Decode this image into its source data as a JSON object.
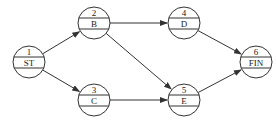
{
  "diagram": {
    "type": "activity-on-node network",
    "nodes": [
      {
        "id": "1",
        "number": "1",
        "name": "ST",
        "x": 29,
        "y": 62
      },
      {
        "id": "2",
        "number": "2",
        "name": "B",
        "x": 94,
        "y": 23
      },
      {
        "id": "3",
        "number": "3",
        "name": "C",
        "x": 94,
        "y": 100
      },
      {
        "id": "4",
        "number": "4",
        "name": "D",
        "x": 184,
        "y": 23
      },
      {
        "id": "5",
        "number": "5",
        "name": "E",
        "x": 184,
        "y": 100
      },
      {
        "id": "6",
        "number": "6",
        "name": "FIN",
        "x": 256,
        "y": 62
      }
    ],
    "edges": [
      {
        "from": "1",
        "to": "2"
      },
      {
        "from": "1",
        "to": "3"
      },
      {
        "from": "2",
        "to": "4"
      },
      {
        "from": "2",
        "to": "5"
      },
      {
        "from": "3",
        "to": "5"
      },
      {
        "from": "4",
        "to": "6"
      },
      {
        "from": "5",
        "to": "6"
      }
    ],
    "colors": {
      "stroke": "#333333",
      "background": "#ffffff"
    }
  }
}
